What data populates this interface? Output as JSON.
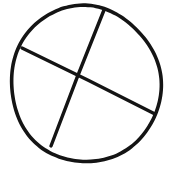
{
  "document": {
    "title": "Hand-drawn circle divided by two crossing chords",
    "width": 169,
    "height": 169,
    "background_color": "#ffffff",
    "ink_color": "#141414",
    "style": "hand-drawn black ink line art, scanned, no text"
  },
  "figure": {
    "name": "circle-with-two-chords",
    "text_labels": [],
    "shapes": [
      {
        "id": "circle-outline",
        "type": "ellipse",
        "cx": 85.5,
        "cy": 84.0,
        "rx": 75.0,
        "ry": 78.0,
        "rotation_deg": -4,
        "stroke_color": "#141414",
        "stroke_width": 3.6,
        "bbox": {
          "x_min": 10,
          "y_min": 6,
          "x_max": 161,
          "y_max": 162
        }
      },
      {
        "id": "chord-upper-right-to-lower-left",
        "type": "line",
        "x1": 104,
        "y1": 10,
        "x2": 51,
        "y2": 146,
        "stroke_color": "#141414",
        "stroke_width": 3.4
      },
      {
        "id": "chord-upper-left-to-lower-right",
        "type": "line",
        "x1": 22,
        "y1": 48,
        "x2": 155,
        "y2": 114,
        "stroke_color": "#141414",
        "stroke_width": 3.4
      }
    ],
    "intersection": {
      "id": "chord-crossing-point",
      "x": 78,
      "y": 77
    },
    "regions": [
      {
        "id": "region-top",
        "label": ""
      },
      {
        "id": "region-right",
        "label": ""
      },
      {
        "id": "region-bottom",
        "label": ""
      },
      {
        "id": "region-left",
        "label": ""
      }
    ]
  }
}
